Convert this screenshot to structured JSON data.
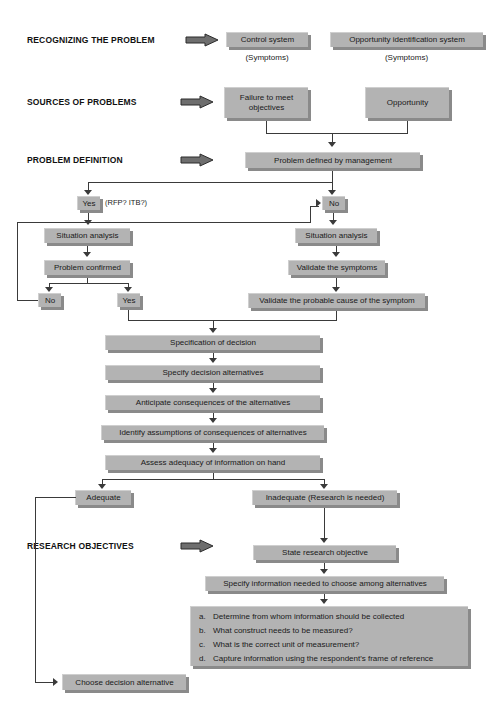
{
  "diagram": {
    "colors": {
      "box_fill": "#b3b3b3",
      "box_shadow": "#8a8a8a",
      "line": "#3a3a3a",
      "text": "#1a1a1a"
    }
  },
  "stage_labels": [
    {
      "id": "recognizing",
      "text": "RECOGNIZING THE PROBLEM"
    },
    {
      "id": "sources",
      "text": "SOURCES OF PROBLEMS"
    },
    {
      "id": "definition",
      "text": "PROBLEM DEFINITION"
    },
    {
      "id": "objectives",
      "text": "RESEARCH OBJECTIVES"
    }
  ],
  "nodes": {
    "control_system": "Control system",
    "control_system_caption": "(Symptoms)",
    "opportunity_system": "Opportunity identification system",
    "opportunity_system_caption": "(Symptoms)",
    "failure_to_meet": "Failure to meet objectives",
    "opportunity": "Opportunity",
    "problem_defined": "Problem defined by management",
    "decision_yes": "Yes",
    "decision_note": "(RFP? ITB?)",
    "decision_no": "No",
    "situation_analysis_left": "Situation analysis",
    "situation_analysis_right": "Situation analysis",
    "problem_confirmed": "Problem confirmed",
    "confirm_no": "No",
    "confirm_yes": "Yes",
    "validate_symptoms": "Validate the symptoms",
    "validate_cause": "Validate the probable cause of the symptom",
    "specification_of_decision": "Specification of decision",
    "specify_alternatives": "Specify decision alternatives",
    "anticipate_consequences": "Anticipate consequences of the alternatives",
    "identify_assumptions": "Identify assumptions of consequences of alternatives",
    "assess_adequacy": "Assess adequacy of information on hand",
    "adequate": "Adequate",
    "inadequate": "Inadequate (Research is needed)",
    "state_research_objective": "State research objective",
    "specify_information": "Specify information needed to choose among alternatives",
    "choose_decision_alternative": "Choose decision alternative"
  },
  "information_list": [
    {
      "letter": "a.",
      "text": "Determine from whom information should be collected"
    },
    {
      "letter": "b.",
      "text": "What construct needs to be measured?"
    },
    {
      "letter": "c.",
      "text": "What is the correct unit of measurement?"
    },
    {
      "letter": "d.",
      "text": "Capture information using the respondent's frame of reference"
    }
  ]
}
